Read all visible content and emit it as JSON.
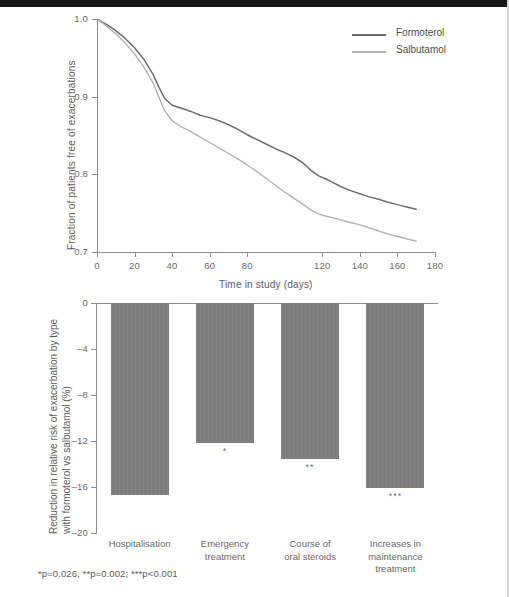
{
  "figure": {
    "footnote": "*p=0.026, **p=0.002; ***p<0.001"
  },
  "chart_data": [
    {
      "type": "line",
      "title": "",
      "xlabel": "Time in study (days)",
      "ylabel": "Fraction of patients free of exacerbations",
      "xlim": [
        0,
        180
      ],
      "ylim": [
        0.7,
        1.0
      ],
      "xticks": [
        0,
        20,
        40,
        60,
        80,
        120,
        140,
        160,
        180
      ],
      "xtick_labels": [
        "0",
        "20",
        "40",
        "60",
        "80",
        "120",
        "140",
        "160",
        "180"
      ],
      "yticks": [
        0.7,
        0.8,
        0.9,
        1.0
      ],
      "ytick_labels": [
        "0.7",
        "0.8",
        "0.9",
        "1.0"
      ],
      "grid": false,
      "legend_position": "top-right",
      "series": [
        {
          "name": "Formoterol",
          "color": "#6d6d6d",
          "x": [
            0,
            5,
            10,
            15,
            20,
            25,
            30,
            33,
            36,
            40,
            45,
            50,
            55,
            60,
            65,
            70,
            75,
            80,
            85,
            90,
            95,
            100,
            105,
            110,
            114,
            118,
            122,
            126,
            130,
            135,
            140,
            145,
            150,
            155,
            160,
            165,
            170
          ],
          "y": [
            1.0,
            0.993,
            0.985,
            0.975,
            0.963,
            0.948,
            0.928,
            0.912,
            0.898,
            0.889,
            0.885,
            0.881,
            0.876,
            0.873,
            0.869,
            0.864,
            0.858,
            0.851,
            0.845,
            0.839,
            0.833,
            0.828,
            0.822,
            0.814,
            0.805,
            0.798,
            0.794,
            0.789,
            0.784,
            0.779,
            0.775,
            0.771,
            0.768,
            0.764,
            0.761,
            0.758,
            0.755
          ]
        },
        {
          "name": "Salbutamol",
          "color": "#b2b2b2",
          "x": [
            0,
            5,
            10,
            15,
            20,
            25,
            30,
            33,
            36,
            40,
            45,
            50,
            55,
            60,
            65,
            70,
            75,
            80,
            85,
            90,
            95,
            100,
            105,
            110,
            114,
            118,
            122,
            126,
            130,
            135,
            140,
            145,
            150,
            155,
            160,
            165,
            170
          ],
          "y": [
            1.0,
            0.991,
            0.981,
            0.969,
            0.955,
            0.938,
            0.917,
            0.899,
            0.882,
            0.869,
            0.861,
            0.855,
            0.848,
            0.841,
            0.834,
            0.827,
            0.82,
            0.812,
            0.804,
            0.795,
            0.786,
            0.777,
            0.769,
            0.761,
            0.754,
            0.749,
            0.746,
            0.744,
            0.741,
            0.738,
            0.735,
            0.731,
            0.727,
            0.723,
            0.72,
            0.717,
            0.714
          ]
        }
      ]
    },
    {
      "type": "bar",
      "title": "",
      "xlabel": "",
      "ylabel": "Reduction in relative risk of exacerbation by type with formoterol vs salbutamol (%)",
      "ylabel_lines": [
        "Reduction in relative risk of exacerbation by type",
        "with formoterol vs salbutamol (%)"
      ],
      "ylim": [
        -20,
        0
      ],
      "yticks": [
        0,
        -4,
        -8,
        -12,
        -16,
        -20
      ],
      "ytick_labels": [
        "0",
        "–4",
        "–8",
        "–12",
        "–16",
        "–20"
      ],
      "grid": false,
      "bar_color": "#7d7d7d",
      "categories": [
        "Hospitalisation",
        "Emergency treatment",
        "Course of oral steroids",
        "Increases in maintenance treatment"
      ],
      "category_lines": [
        [
          "Hospitalisation"
        ],
        [
          "Emergency",
          "treatment"
        ],
        [
          "Course of",
          "oral steroids"
        ],
        [
          "Increases in",
          "maintenance",
          "treatment"
        ]
      ],
      "values": [
        -16.7,
        -12.2,
        -13.6,
        -16.1
      ],
      "annotations": [
        "",
        "*",
        "**",
        "***"
      ]
    }
  ]
}
